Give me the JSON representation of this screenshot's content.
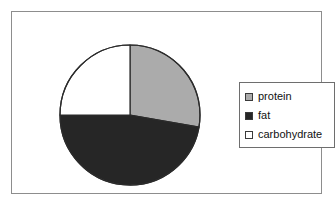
{
  "figure": {
    "background_color": "#ffffff",
    "frame_color": "#8d8d8d"
  },
  "chart_data": {
    "type": "pie",
    "title": "",
    "labels": [
      "protein",
      "fat",
      "carbohydrate"
    ],
    "values": [
      28,
      47,
      25
    ],
    "units": "percent",
    "colors": [
      "#ababab",
      "#262626",
      "#ffffff"
    ],
    "slice_edge_color": "#2b2b2b",
    "start_angle_deg": 90,
    "direction": "clockwise",
    "legend_position": "right",
    "grid": false,
    "slices": [
      {
        "label": "protein",
        "value": 28,
        "color": "#ababab",
        "start_deg": 0,
        "end_deg": 100
      },
      {
        "label": "fat",
        "value": 47,
        "color": "#262626",
        "start_deg": 100,
        "end_deg": 270
      },
      {
        "label": "carbohydrate",
        "value": 25,
        "color": "#ffffff",
        "start_deg": 270,
        "end_deg": 360
      }
    ]
  },
  "legend": {
    "border_color": "#6e6e6e",
    "items": [
      {
        "label": "protein",
        "swatch_color": "#ababab"
      },
      {
        "label": "fat",
        "swatch_color": "#262626"
      },
      {
        "label": "carbohydrate",
        "swatch_color": "#ffffff"
      }
    ]
  }
}
